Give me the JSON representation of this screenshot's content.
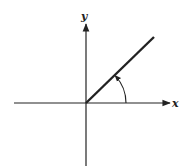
{
  "diagram": {
    "type": "angle-in-standard-position",
    "labels": {
      "x_axis": "x",
      "y_axis": "y"
    },
    "colors": {
      "stroke": "#222222",
      "background": "#ffffff"
    },
    "geometry": {
      "origin": [
        86,
        103
      ],
      "x_axis": {
        "from": [
          14,
          103
        ],
        "to": [
          170,
          103
        ]
      },
      "y_axis": {
        "from": [
          86,
          166
        ],
        "to": [
          86,
          22
        ]
      },
      "terminal_ray": {
        "from": [
          86,
          103
        ],
        "to": [
          154,
          37
        ]
      },
      "angle_arc": {
        "radius": 40,
        "start_deg": 0,
        "end_deg": 44,
        "direction": "counterclockwise"
      }
    }
  }
}
